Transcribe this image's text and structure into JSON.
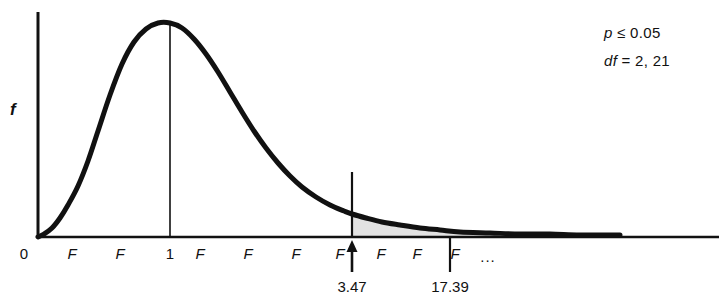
{
  "figure": {
    "title": "",
    "y_axis_label": "f",
    "ellipsis": "..."
  },
  "annotations": {
    "significance": "p ≤ 0.05",
    "significance_symbol": "p",
    "significance_rest": " ≤ 0.05",
    "degrees_of_freedom": "df = 2, 21",
    "df_symbol": "df",
    "df_rest": " = 2, 21"
  },
  "markers": [
    {
      "name": "critical-value",
      "label": "3.47",
      "x_px": 352
    },
    {
      "name": "obtained-value",
      "label": "17.39",
      "x_px": 450
    }
  ],
  "chart_data": {
    "type": "line",
    "xlabel": "F",
    "ylabel": "f",
    "grid": false,
    "legend": null,
    "x_tick_labels": [
      "0",
      "F",
      "F",
      "1",
      "F",
      "F",
      "F",
      "F",
      "F",
      "F",
      "F",
      "..."
    ],
    "x_tick_px": [
      24,
      72,
      120,
      170,
      200,
      248,
      296,
      340,
      381,
      417,
      455,
      488
    ],
    "y_tick_labels": [],
    "distribution": "F",
    "df_numerator": 2,
    "df_denominator": 21,
    "alpha": 0.05,
    "critical_value": 3.47,
    "obtained_value": 17.39,
    "peak_x_label": "1",
    "shaded_region": {
      "label": "rejection region",
      "from": 3.47,
      "to": "infinity",
      "fill": "#e0e0e0",
      "area": 0.05
    },
    "curve_points": [
      [
        38,
        237
      ],
      [
        44,
        234
      ],
      [
        52,
        228
      ],
      [
        60,
        218
      ],
      [
        68,
        205
      ],
      [
        78,
        186
      ],
      [
        88,
        161
      ],
      [
        98,
        131
      ],
      [
        110,
        95
      ],
      [
        122,
        64
      ],
      [
        134,
        42
      ],
      [
        146,
        29
      ],
      [
        158,
        23
      ],
      [
        170,
        23
      ],
      [
        182,
        28
      ],
      [
        194,
        39
      ],
      [
        206,
        54
      ],
      [
        218,
        72
      ],
      [
        230,
        92
      ],
      [
        242,
        112
      ],
      [
        254,
        131
      ],
      [
        266,
        148
      ],
      [
        278,
        163
      ],
      [
        290,
        176
      ],
      [
        302,
        187
      ],
      [
        316,
        197
      ],
      [
        330,
        205
      ],
      [
        344,
        211
      ],
      [
        352,
        214
      ],
      [
        366,
        218
      ],
      [
        382,
        222
      ],
      [
        400,
        225
      ],
      [
        420,
        228
      ],
      [
        440,
        230
      ],
      [
        460,
        232
      ],
      [
        490,
        233
      ],
      [
        520,
        234
      ],
      [
        550,
        234
      ],
      [
        580,
        235
      ],
      [
        620,
        235
      ]
    ],
    "axis_range_px": {
      "x_min": 38,
      "x_max": 719,
      "y_baseline": 237,
      "y_top": 12
    }
  },
  "colors": {
    "curve": "#111111",
    "axis": "#111111",
    "shade": "#e2e2e2",
    "text": "#111111"
  }
}
